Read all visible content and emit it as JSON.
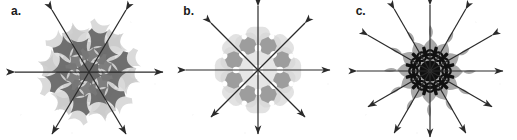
{
  "figure": {
    "background_color": "#ffffff",
    "width": 517,
    "height": 140,
    "panel_count": 3
  },
  "panels": [
    {
      "label": "a.",
      "name": "panel-a",
      "symmetry_order": 6,
      "axis_count": 3,
      "axis_angles_deg": [
        0,
        60,
        120
      ],
      "arrow_type": "double-headed",
      "arrow_color": "#2a2a2a",
      "motif": "pinwheel-rosette",
      "center_x": 89,
      "center_y": 72,
      "radius": 48,
      "arrow_length": 66,
      "layers": [
        {
          "name": "dark-pinwheels",
          "color": "#6e6e6e",
          "count": 6,
          "ring_radius": 30
        },
        {
          "name": "mid-pinwheels",
          "color": "#8a8a8a",
          "count": 6,
          "ring_radius": 18
        },
        {
          "name": "light-pinwheels",
          "color": "#cfcfcf",
          "count": 6,
          "ring_radius": 38
        },
        {
          "name": "disc-halo",
          "color": "#b8b8b8",
          "count": 1,
          "ring_radius": 0
        }
      ]
    },
    {
      "label": "b.",
      "name": "panel-b",
      "symmetry_order": 8,
      "axis_count": 4,
      "axis_angles_deg": [
        0,
        45,
        90,
        135
      ],
      "arrow_type": "double-headed",
      "arrow_color": "#2a2a2a",
      "motif": "octagonal-blob-rosette",
      "center_x": 86,
      "center_y": 70,
      "radius": 46,
      "arrow_length": 64,
      "layers": [
        {
          "name": "light-squares",
          "color": "#dcdcdc",
          "count": 8,
          "ring_radius": 30
        },
        {
          "name": "pale-squares",
          "color": "#e6e6e6",
          "count": 8,
          "ring_radius": 17
        },
        {
          "name": "dark-octagons",
          "color": "#9a9a9a",
          "count": 8,
          "ring_radius": 26
        },
        {
          "name": "white-dots",
          "color": "#ffffff",
          "count": 8,
          "ring_radius": 22
        }
      ]
    },
    {
      "label": "c.",
      "name": "panel-c",
      "symmetry_order": 12,
      "axis_count": 6,
      "axis_angles_deg": [
        0,
        30,
        60,
        90,
        120,
        150
      ],
      "arrow_type": "double-headed",
      "arrow_color": "#2a2a2a",
      "motif": "flame-and-snowflake-rosette",
      "center_x": 85,
      "center_y": 71,
      "radius": 50,
      "arrow_length": 68,
      "layers": [
        {
          "name": "gray-flames",
          "color": "#a8a8a8",
          "count": 12,
          "ring_radius": 36
        },
        {
          "name": "black-snowflake-core",
          "color": "#111111",
          "count": 12,
          "ring_radius": 17
        },
        {
          "name": "core-ring",
          "color": "#111111",
          "count": 1,
          "ring_radius": 9
        }
      ]
    }
  ]
}
